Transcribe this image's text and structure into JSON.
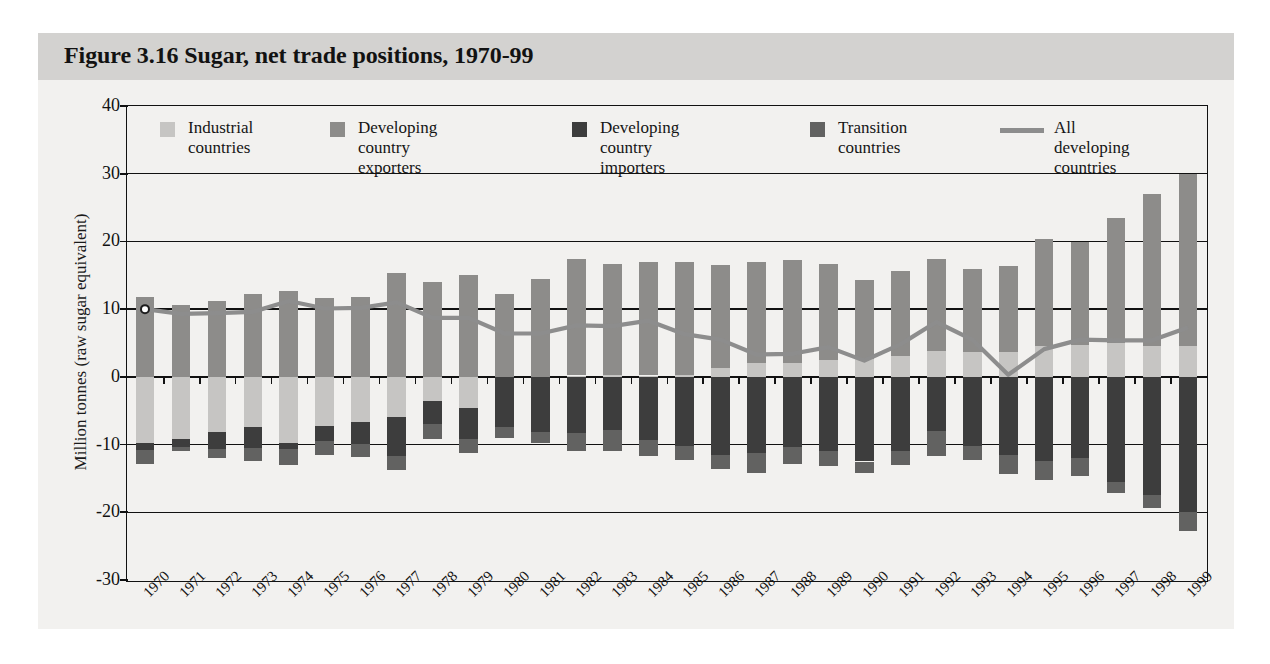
{
  "figure": {
    "title": "Figure 3.16  Sugar, net trade positions, 1970-99",
    "background": "#f2f1ef",
    "title_band_color": "#d3d2d0"
  },
  "legend": {
    "position": "top-inside",
    "items": [
      {
        "label": "Industrial\ncountries",
        "color": "#c6c5c3",
        "type": "swatch"
      },
      {
        "label": "Developing country\nexporters",
        "color": "#8d8c8a",
        "type": "swatch"
      },
      {
        "label": "Developing country\nimporters",
        "color": "#3d3d3d",
        "type": "swatch"
      },
      {
        "label": "Transition\ncountries",
        "color": "#626261",
        "type": "swatch"
      },
      {
        "label": "All developing\ncountries",
        "color": "#8d8d8d",
        "type": "line"
      }
    ]
  },
  "chart_data": {
    "type": "bar",
    "title": "Figure 3.16  Sugar, net trade positions, 1970-99",
    "xlabel": "",
    "ylabel": "Million tonnes (raw sugar equivalent)",
    "ylim": [
      -30,
      40
    ],
    "yticks": [
      40,
      30,
      20,
      10,
      0,
      -10,
      -20,
      -30
    ],
    "grid": true,
    "stacked": true,
    "categories": [
      "1970",
      "1971",
      "1972",
      "1973",
      "1974",
      "1975",
      "1976",
      "1977",
      "1978",
      "1979",
      "1980",
      "1981",
      "1982",
      "1983",
      "1984",
      "1985",
      "1986",
      "1987",
      "1988",
      "1989",
      "1990",
      "1991",
      "1992",
      "1993",
      "1994",
      "1995",
      "1996",
      "1997",
      "1998",
      "1999"
    ],
    "series": [
      {
        "name": "Developing country exporters",
        "color": "#8d8c8a",
        "stack": "positive",
        "values": [
          11.8,
          10.6,
          11.2,
          12.2,
          12.7,
          11.7,
          11.8,
          15.3,
          14.0,
          15.0,
          12.3,
          14.5,
          17.2,
          16.4,
          16.7,
          16.7,
          15.2,
          15.0,
          15.3,
          14.2,
          11.6,
          12.6,
          13.6,
          12.2,
          12.6,
          15.8,
          15.2,
          18.5,
          22.5,
          25.5
        ]
      },
      {
        "name": "Industrial countries",
        "color": "#c6c5c3",
        "stack": "positive",
        "values": [
          0.0,
          0.0,
          0.0,
          0.0,
          0.0,
          0.0,
          0.0,
          0.0,
          0.0,
          0.0,
          0.0,
          0.0,
          0.2,
          0.3,
          0.2,
          0.3,
          1.3,
          2.0,
          2.0,
          2.5,
          2.7,
          3.1,
          3.8,
          3.7,
          3.7,
          4.6,
          4.7,
          5.0,
          4.5,
          4.5
        ]
      },
      {
        "name": "Developing country importers",
        "color": "#3d3d3d",
        "stack": "negative",
        "values": [
          -1.0,
          -1.2,
          -2.6,
          -3.1,
          -1.0,
          -2.2,
          -3.3,
          -5.8,
          -3.5,
          -4.6,
          -7.4,
          -8.1,
          -8.3,
          -7.9,
          -9.3,
          -10.2,
          -11.6,
          -11.3,
          -10.4,
          -10.9,
          -12.5,
          -11.0,
          -8.0,
          -10.2,
          -11.6,
          -12.4,
          -12.0,
          -15.6,
          -17.5,
          -20.0
        ]
      },
      {
        "name": "Transition countries",
        "color": "#626261",
        "stack": "negative",
        "values": [
          -2.0,
          -0.6,
          -1.3,
          -2.0,
          -2.3,
          -2.0,
          -1.9,
          -2.1,
          -2.2,
          -2.1,
          -1.6,
          -1.7,
          -2.7,
          -3.0,
          -2.4,
          -2.1,
          -2.0,
          -2.9,
          -2.5,
          -2.3,
          -1.7,
          -2.0,
          -3.7,
          -2.1,
          -2.7,
          -2.8,
          -2.7,
          -1.6,
          -1.9,
          -2.7
        ]
      },
      {
        "name": "Industrial countries (net importers)",
        "color": "#c6c5c3",
        "stack": "negative-top",
        "values": [
          -9.8,
          -9.2,
          -8.1,
          -7.4,
          -9.7,
          -7.3,
          -6.6,
          -5.9,
          -3.5,
          -4.6,
          -0.0,
          0.0,
          0.0,
          0.0,
          0.0,
          0.0,
          0.0,
          0.0,
          0.0,
          0.0,
          0.0,
          0.0,
          0.0,
          0.0,
          0.0,
          0.0,
          0.0,
          0.0,
          0.0,
          0.0
        ]
      }
    ],
    "line_series": {
      "name": "All developing countries",
      "color": "#8d8d8d",
      "marker_at_first": true,
      "values": [
        10.0,
        9.3,
        9.4,
        9.6,
        11.2,
        10.1,
        10.2,
        11.0,
        8.7,
        8.7,
        6.4,
        6.4,
        7.6,
        7.5,
        8.3,
        6.3,
        5.5,
        3.3,
        3.4,
        4.4,
        2.4,
        4.8,
        8.1,
        5.5,
        0.3,
        4.1,
        5.5,
        5.4,
        5.4,
        7.3
      ]
    }
  }
}
